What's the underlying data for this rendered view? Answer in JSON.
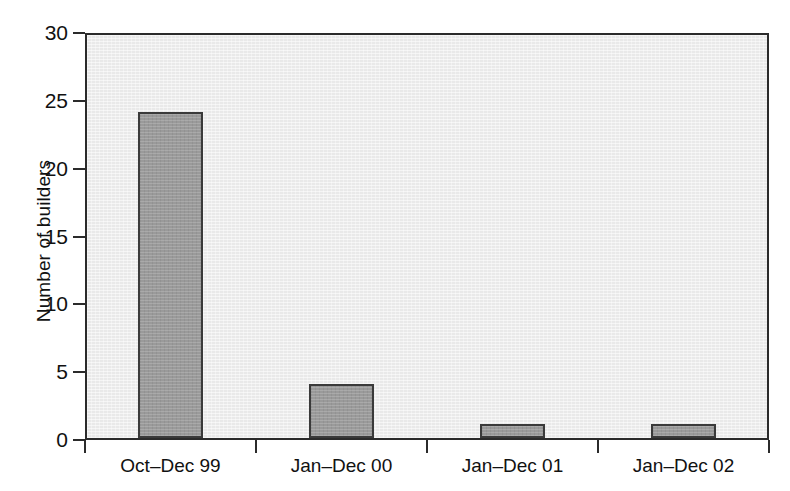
{
  "chart_data": {
    "type": "bar",
    "title": "",
    "xlabel": "",
    "ylabel": "Number of builders",
    "categories": [
      "Oct–Dec 99",
      "Jan–Dec 00",
      "Jan–Dec 01",
      "Jan–Dec 02"
    ],
    "values": [
      24,
      4,
      1,
      1
    ],
    "ylim": [
      0,
      30
    ],
    "yticks": [
      0,
      5,
      10,
      15,
      20,
      25,
      30
    ],
    "ytick_labels": [
      "0",
      "5",
      "10",
      "15",
      "20",
      "25",
      "30"
    ],
    "grid": false,
    "legend": "none",
    "colors": {
      "bar_fill": "#9a9a9a",
      "bar_edge": "#3a3a3a",
      "plot_background": "#e9e9e9",
      "figure_background": "#ffffff",
      "axis": "#2b2b2b",
      "text": "#111111"
    }
  }
}
